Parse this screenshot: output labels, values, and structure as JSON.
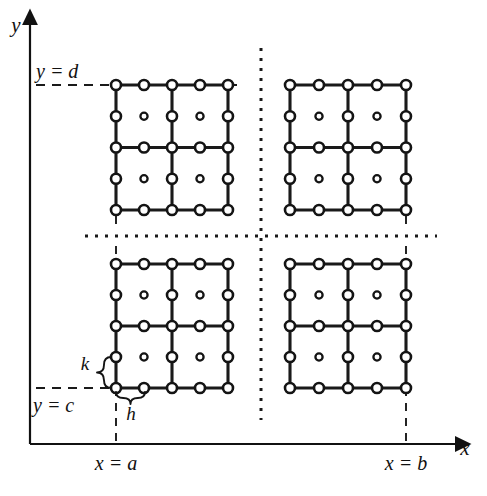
{
  "figure": {
    "background_color": "#ffffff",
    "ink_color": "#141414"
  },
  "axes": {
    "x_axis_label": "x",
    "y_axis_label": "y",
    "x_axis": {
      "y": 444,
      "x_start": 30,
      "x_end": 455
    },
    "y_axis": {
      "x": 30,
      "y_start": 444,
      "y_end": 25
    },
    "arrow_size": 11
  },
  "boundary_labels": {
    "top": "y = d",
    "bottom": "y = c",
    "left": "x = a",
    "right": "x = b"
  },
  "spacing_labels": {
    "vertical": "k",
    "horizontal": "h"
  },
  "geometry": {
    "x_a": 116,
    "x_b": 406,
    "y_d": 85,
    "y_c": 388,
    "center_x": 261,
    "center_y": 236,
    "node_radius": 5.0,
    "center_node_radius": 3.6
  },
  "blocks": [
    {
      "name": "block-top-left",
      "x0": 116,
      "x1": 228,
      "y0": 85,
      "y1": 210
    },
    {
      "name": "block-top-right",
      "x0": 290,
      "x1": 406,
      "y0": 85,
      "y1": 210
    },
    {
      "name": "block-bottom-left",
      "x0": 116,
      "x1": 228,
      "y0": 264,
      "y1": 388
    },
    {
      "name": "block-bottom-right",
      "x0": 290,
      "x1": 406,
      "y0": 264,
      "y1": 388
    }
  ],
  "block_structure": {
    "cells_per_side": 2,
    "nodes_per_side": 5,
    "element_type": "nine-node quadrilateral",
    "description": "Each block holds 2x2 cells; nodes at every corner, every edge midpoint, and one interior center node per cell."
  },
  "guides": {
    "dashed_y_d": {
      "x_start": 36,
      "x_end": 237,
      "y": 85
    },
    "dashed_y_c": {
      "x_start": 36,
      "x_end": 120,
      "y": 388
    },
    "dashed_x_a": {
      "x": 116,
      "y_start": 388,
      "y_end": 444
    },
    "dashed_x_b": {
      "x": 406,
      "y_start": 388,
      "y_end": 444
    },
    "dotted_vertical": {
      "x": 261,
      "y_start": 48,
      "y_end": 420
    },
    "dotted_horizontal": {
      "y": 236,
      "x_start": 85,
      "x_end": 437
    },
    "tick_top_left": {
      "x": 116,
      "y_start": 216,
      "y_end": 228
    },
    "tick_bottom_left": {
      "x": 116,
      "y_start": 246,
      "y_end": 258
    },
    "tick_top_right": {
      "x": 406,
      "y_start": 216,
      "y_end": 228
    },
    "tick_bottom_right": {
      "x": 406,
      "y_start": 246,
      "y_end": 258
    }
  },
  "braces": {
    "k_brace": {
      "x": 104,
      "y_top": 357,
      "y_bottom": 388,
      "label_x": 85,
      "label_y": 370
    },
    "h_brace": {
      "y": 398,
      "x_left": 116,
      "x_right": 145,
      "label_x": 131,
      "label_y": 420
    }
  },
  "label_positions": {
    "y_axis_name": {
      "x": 8,
      "y": 32
    },
    "x_axis_name": {
      "x": 465,
      "y": 455
    },
    "y_equals_d": {
      "x": 36,
      "y": 78
    },
    "y_equals_c": {
      "x": 33,
      "y": 412
    },
    "x_equals_a": {
      "x": 116,
      "y": 470
    },
    "x_equals_b": {
      "x": 406,
      "y": 470
    }
  }
}
